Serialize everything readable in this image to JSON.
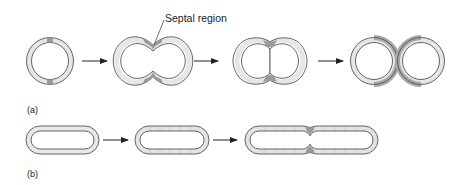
{
  "figure": {
    "panels": [
      {
        "id": "a",
        "label": "(a)",
        "description": "Coccus division: septal growth zone producing two spherical cells",
        "stages": [
          "single coccus with two growth bands",
          "constricted cell with septal region",
          "deeply constricted figure-eight",
          "two separated cocci"
        ]
      },
      {
        "id": "b",
        "label": "(b)",
        "description": "Rod division: elongation then septation",
        "stages": [
          "short rod",
          "rod with dispersed wall growth",
          "elongated rod with central constriction"
        ]
      }
    ],
    "annotations": {
      "septal_region": "Septal region"
    },
    "colors": {
      "outline": "#555555",
      "wall_fill": "#e6e6e6",
      "new_wall": "#9a9a9a",
      "arrow": "#222222",
      "background": "#ffffff"
    }
  }
}
